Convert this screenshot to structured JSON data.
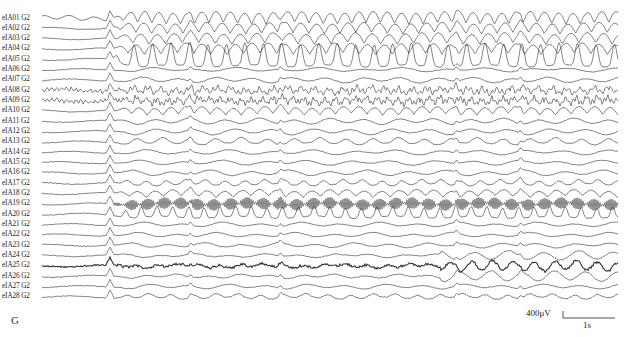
{
  "panel_label": "G",
  "scale_bar": {
    "amplitude_label": "400μV",
    "time_label": "1s",
    "amplitude_uv": 400,
    "time_s": 1
  },
  "chart_data": {
    "type": "line",
    "title": "",
    "xlabel": "",
    "ylabel": "",
    "grid": false,
    "legend": "none",
    "x_pixel_range": [
      42,
      618
    ],
    "duration_s_approx": 11,
    "onset_x_px": 109,
    "recurring_discharges_x_px": [
      190,
      280,
      456,
      520
    ],
    "series": [
      {
        "name": "eIA01 G2",
        "pattern": "rhythmic-sharp",
        "amp": 5.5,
        "freq": 0.22,
        "noise": 0.5
      },
      {
        "name": "eIA02 G2",
        "pattern": "rhythmic",
        "amp": 5.0,
        "freq": 0.2,
        "noise": 0.5
      },
      {
        "name": "eIA03 G2",
        "pattern": "rhythmic",
        "amp": 5.0,
        "freq": 0.19,
        "noise": 0.5
      },
      {
        "name": "eIA04 G2",
        "pattern": "rhythmic",
        "amp": 5.0,
        "freq": 0.19,
        "noise": 0.6
      },
      {
        "name": "eIA05 G2",
        "pattern": "spiky",
        "amp": 11.0,
        "freq": 0.17,
        "noise": 0.8
      },
      {
        "name": "eIA06 G2",
        "pattern": "flat",
        "amp": 1.2,
        "freq": 0.15,
        "noise": 0.6
      },
      {
        "name": "eIA07 G2",
        "pattern": "low",
        "amp": 2.0,
        "freq": 0.17,
        "noise": 0.8
      },
      {
        "name": "eIA08 G2",
        "pattern": "fast",
        "amp": 4.0,
        "freq": 0.45,
        "noise": 1.6
      },
      {
        "name": "eIA09 G2",
        "pattern": "fast",
        "amp": 4.0,
        "freq": 0.6,
        "noise": 1.6
      },
      {
        "name": "eIA10 G2",
        "pattern": "rhythmic",
        "amp": 3.5,
        "freq": 0.2,
        "noise": 0.8
      },
      {
        "name": "eIA11 G2",
        "pattern": "low",
        "amp": 2.2,
        "freq": 0.18,
        "noise": 0.7
      },
      {
        "name": "eIA12 G2",
        "pattern": "low",
        "amp": 2.2,
        "freq": 0.16,
        "noise": 0.7
      },
      {
        "name": "eIA13 G2",
        "pattern": "bumpy",
        "amp": 3.5,
        "freq": 0.12,
        "noise": 0.7
      },
      {
        "name": "eIA14 G2",
        "pattern": "low",
        "amp": 1.6,
        "freq": 0.15,
        "noise": 0.6
      },
      {
        "name": "eIA15 G2",
        "pattern": "low",
        "amp": 1.6,
        "freq": 0.15,
        "noise": 0.6
      },
      {
        "name": "eIA16 G2",
        "pattern": "low",
        "amp": 2.0,
        "freq": 0.16,
        "noise": 0.7
      },
      {
        "name": "eIA17 G2",
        "pattern": "bumpy",
        "amp": 3.0,
        "freq": 0.16,
        "noise": 0.7
      },
      {
        "name": "eIA18 G2",
        "pattern": "rhythmic",
        "amp": 3.0,
        "freq": 0.18,
        "noise": 0.7
      },
      {
        "name": "eIA19 G2",
        "pattern": "loops",
        "amp": 7.0,
        "freq": 0.19,
        "noise": 0.5
      },
      {
        "name": "eIA20 G2",
        "pattern": "spiky-small",
        "amp": 5.0,
        "freq": 0.2,
        "noise": 0.8
      },
      {
        "name": "eIA21 G2",
        "pattern": "low",
        "amp": 1.5,
        "freq": 0.16,
        "noise": 0.6
      },
      {
        "name": "eIA22 G2",
        "pattern": "low",
        "amp": 1.5,
        "freq": 0.16,
        "noise": 0.6
      },
      {
        "name": "eIA23 G2",
        "pattern": "low",
        "amp": 1.6,
        "freq": 0.17,
        "noise": 0.7
      },
      {
        "name": "eIA24 G2",
        "pattern": "low-late",
        "amp": 1.8,
        "freq": 0.18,
        "noise": 0.8
      },
      {
        "name": "eIA25 G2",
        "pattern": "thick-late",
        "amp": 2.0,
        "freq": 0.3,
        "noise": 1.3
      },
      {
        "name": "eIA26 G2",
        "pattern": "low-late",
        "amp": 2.0,
        "freq": 0.2,
        "noise": 0.9
      },
      {
        "name": "eIA27 G2",
        "pattern": "low",
        "amp": 1.6,
        "freq": 0.16,
        "noise": 0.7
      },
      {
        "name": "eIA28 G2",
        "pattern": "bumpy",
        "amp": 2.5,
        "freq": 0.14,
        "noise": 0.8
      }
    ]
  }
}
